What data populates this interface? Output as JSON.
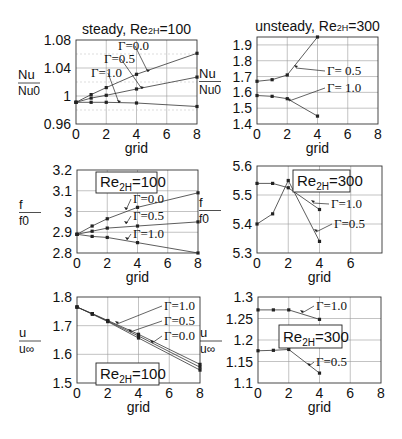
{
  "figure": {
    "x_label": "grid",
    "panels_layout": "3 rows x 2 columns"
  },
  "chart_data": [
    {
      "id": "nu-steady",
      "type": "line",
      "title": "steady, Re2H=100",
      "title_main": "steady, Re",
      "title_sub": "2H",
      "title_tail": "=100",
      "xlabel": "grid",
      "ylabel_top": "Nu",
      "ylabel_bottom": "Nu0",
      "xlim": [
        0,
        8
      ],
      "ylim": [
        0.96,
        1.08
      ],
      "xticks": [
        0,
        2,
        4,
        6,
        8
      ],
      "yticks": [
        0.96,
        1,
        1.04,
        1.08
      ],
      "ytick_labels": [
        "0.96",
        "1",
        "1.04",
        "1.08"
      ],
      "minor_ygrid": [
        0.98,
        1.02,
        1.06
      ],
      "grid": true,
      "box": [
        76,
        40,
        197,
        124
      ],
      "series": [
        {
          "name": "Γ=0.0",
          "x": [
            0,
            1,
            2,
            4,
            8
          ],
          "y": [
            0.991,
            1.002,
            1.012,
            1.031,
            1.061
          ]
        },
        {
          "name": "Γ=0.5",
          "x": [
            0,
            1,
            2,
            4,
            8
          ],
          "y": [
            0.991,
            0.997,
            1.001,
            1.01,
            1.027
          ]
        },
        {
          "name": "Γ=1.0",
          "x": [
            0,
            1,
            2,
            4,
            8
          ],
          "y": [
            0.991,
            0.991,
            0.991,
            0.99,
            0.985
          ]
        }
      ],
      "annotations": [
        {
          "text": "Γ=0.0",
          "tx": 118,
          "ty": 50,
          "ax": 148,
          "ay": 72
        },
        {
          "text": "Γ=0.5",
          "tx": 104,
          "ty": 63,
          "ax": 142,
          "ay": 89
        },
        {
          "text": "Γ=1.0",
          "tx": 91,
          "ty": 77,
          "ax": 119,
          "ay": 103
        }
      ]
    },
    {
      "id": "nu-unsteady",
      "type": "line",
      "title": "unsteady, Re2H=300",
      "title_main": "unsteady, Re",
      "title_sub": "2H",
      "title_tail": "=300",
      "xlabel": "grid",
      "ylabel_top": "Nu",
      "ylabel_bottom": "Nu0",
      "xlim": [
        0,
        8
      ],
      "ylim": [
        1.4,
        1.95
      ],
      "xticks": [
        0,
        2,
        4,
        6,
        8
      ],
      "yticks": [
        1.4,
        1.5,
        1.6,
        1.7,
        1.8,
        1.9
      ],
      "ytick_labels": [
        "1.4",
        "1.5",
        "1.6",
        "1.7",
        "1.8",
        "1.9"
      ],
      "grid": true,
      "box": [
        257,
        37,
        378,
        124
      ],
      "series": [
        {
          "name": "Γ=0.5",
          "x": [
            0,
            1,
            2,
            4
          ],
          "y": [
            1.67,
            1.68,
            1.71,
            1.95
          ]
        },
        {
          "name": "Γ=1.0",
          "x": [
            0,
            1,
            2,
            4
          ],
          "y": [
            1.58,
            1.575,
            1.56,
            1.45
          ]
        }
      ],
      "annotations": [
        {
          "text": "Γ= 0.5",
          "tx": 327,
          "ty": 75,
          "ax": 296,
          "ay": 68
        },
        {
          "text": "Γ= 1.0",
          "tx": 327,
          "ty": 92,
          "ax": 289,
          "ay": 101
        }
      ]
    },
    {
      "id": "f-steady",
      "type": "line",
      "title": "",
      "xlabel": "grid",
      "ylabel_top": "f",
      "ylabel_bottom": "f0",
      "xlim": [
        0,
        8
      ],
      "ylim": [
        2.8,
        3.2
      ],
      "xticks": [
        0,
        2,
        4,
        6,
        8
      ],
      "yticks": [
        2.8,
        2.9,
        3.0,
        3.1,
        3.2
      ],
      "ytick_labels": [
        "2.8",
        "2.9",
        "3",
        "3.1",
        "3.2"
      ],
      "grid": true,
      "box": [
        77,
        170,
        198,
        253
      ],
      "legend_box": {
        "text_main": "Re",
        "text_sub": "2H",
        "text_tail": "=100",
        "x": 96,
        "y": 172,
        "w": 61,
        "h": 21
      },
      "series": [
        {
          "name": "Γ=0.0",
          "x": [
            0,
            1,
            2,
            4,
            8
          ],
          "y": [
            2.89,
            2.93,
            2.965,
            3.02,
            3.09
          ]
        },
        {
          "name": "Γ=0.5",
          "x": [
            0,
            1,
            2,
            4,
            8
          ],
          "y": [
            2.89,
            2.905,
            2.92,
            2.93,
            2.95
          ]
        },
        {
          "name": "Γ=1.0",
          "x": [
            0,
            1,
            2,
            4,
            8
          ],
          "y": [
            2.89,
            2.88,
            2.875,
            2.85,
            2.8
          ]
        }
      ],
      "annotations": [
        {
          "text": "Γ=0.0",
          "tx": 133,
          "ty": 203,
          "ax": 126,
          "ay": 210
        },
        {
          "text": "Γ=0.5",
          "tx": 133,
          "ty": 220,
          "ax": 126,
          "ay": 224
        },
        {
          "text": "Γ=1.0",
          "tx": 133,
          "ty": 238,
          "ax": 127,
          "ay": 240
        }
      ]
    },
    {
      "id": "f-unsteady",
      "type": "line",
      "title": "",
      "xlabel": "grid",
      "ylabel_top": "f",
      "ylabel_bottom": "f0",
      "xlim": [
        0,
        8
      ],
      "ylim": [
        5.3,
        5.6
      ],
      "xticks": [
        0,
        2,
        4,
        6
      ],
      "xgrid": [
        2,
        4,
        6
      ],
      "yticks": [
        5.3,
        5.4,
        5.5,
        5.6
      ],
      "ytick_labels": [
        "5.3",
        "5.4",
        "5.5",
        "5.6"
      ],
      "grid": true,
      "box": [
        257,
        166,
        382,
        253
      ],
      "legend_box": {
        "text_main": "Re",
        "text_sub": "2H",
        "text_tail": "=300",
        "x": 293,
        "y": 170,
        "w": 57,
        "h": 22
      },
      "series": [
        {
          "name": "Γ=1.0",
          "x": [
            0,
            1,
            2,
            4
          ],
          "y": [
            5.54,
            5.54,
            5.525,
            5.45
          ]
        },
        {
          "name": "Γ=0.5",
          "x": [
            0,
            1,
            2,
            4
          ],
          "y": [
            5.4,
            5.435,
            5.55,
            5.34
          ]
        }
      ],
      "annotations": [
        {
          "text": "Γ=1.0",
          "tx": 331,
          "ty": 208,
          "ax": 313,
          "ay": 203
        },
        {
          "text": "Γ=0.5",
          "tx": 334,
          "ty": 228,
          "ax": 316,
          "ay": 232
        }
      ]
    },
    {
      "id": "u-steady",
      "type": "line",
      "title": "",
      "xlabel": "grid",
      "ylabel_top": "u",
      "ylabel_bottom": "u∞",
      "xlim": [
        0,
        8
      ],
      "ylim": [
        1.5,
        1.8
      ],
      "xticks": [
        0,
        2,
        4,
        6,
        8
      ],
      "yticks": [
        1.5,
        1.6,
        1.7,
        1.8
      ],
      "ytick_labels": [
        "1.5",
        "1.6",
        "1.7",
        "1.8"
      ],
      "grid": true,
      "box": [
        77,
        297,
        200,
        383
      ],
      "legend_box": {
        "text_main": "Re",
        "text_sub": "2H",
        "text_tail": "=100",
        "x": 96,
        "y": 363,
        "w": 63,
        "h": 22
      },
      "series": [
        {
          "name": "Γ=1.0",
          "x": [
            0,
            1,
            2,
            4,
            8
          ],
          "y": [
            1.765,
            1.742,
            1.718,
            1.67,
            1.565
          ]
        },
        {
          "name": "Γ=0.5",
          "x": [
            0,
            1,
            2,
            4,
            8
          ],
          "y": [
            1.765,
            1.741,
            1.716,
            1.664,
            1.555
          ]
        },
        {
          "name": "Γ=0.0",
          "x": [
            0,
            1,
            2,
            4,
            8
          ],
          "y": [
            1.765,
            1.74,
            1.714,
            1.657,
            1.545
          ]
        }
      ],
      "annotations": [
        {
          "text": "Γ=1.0",
          "tx": 164,
          "ty": 310,
          "ax": 117,
          "ay": 324
        },
        {
          "text": "Γ=0.5",
          "tx": 164,
          "ty": 325,
          "ax": 130,
          "ay": 332
        },
        {
          "text": "Γ=0.0",
          "tx": 164,
          "ty": 340,
          "ax": 152,
          "ay": 343
        }
      ]
    },
    {
      "id": "u-unsteady",
      "type": "line",
      "title": "",
      "xlabel": "grid",
      "ylabel_top": "u",
      "ylabel_bottom": "u∞",
      "xlim": [
        0,
        8
      ],
      "ylim": [
        1.1,
        1.3
      ],
      "xticks": [
        0,
        2,
        4,
        6,
        8
      ],
      "yticks": [
        1.1,
        1.15,
        1.2,
        1.25,
        1.3
      ],
      "ytick_labels": [
        "1.1",
        "1.15",
        "1.2",
        "1.25",
        "1.3"
      ],
      "grid": true,
      "box": [
        258,
        297,
        381,
        383
      ],
      "legend_box": {
        "text_main": "Re",
        "text_sub": "2H",
        "text_tail": "=300",
        "x": 279,
        "y": 325,
        "w": 63,
        "h": 23
      },
      "series": [
        {
          "name": "Γ=1.0",
          "x": [
            0,
            1,
            2,
            4
          ],
          "y": [
            1.27,
            1.27,
            1.27,
            1.248
          ]
        },
        {
          "name": "Γ=0.5",
          "x": [
            0,
            1,
            2,
            4
          ],
          "y": [
            1.175,
            1.176,
            1.178,
            1.123
          ]
        }
      ],
      "annotations": [
        {
          "text": "Γ=1.0",
          "tx": 316,
          "ty": 310,
          "ax": 302,
          "ay": 313
        },
        {
          "text": "Γ=0.5",
          "tx": 316,
          "ty": 366,
          "ax": 309,
          "ay": 366
        }
      ]
    }
  ]
}
